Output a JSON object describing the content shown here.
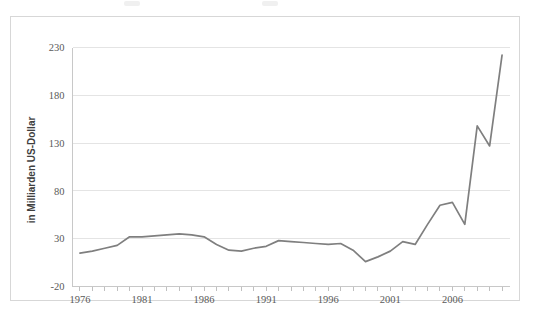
{
  "figure": {
    "background_color": "#ffffff",
    "frame_border_color": "#d7d7d7"
  },
  "chart_data": {
    "type": "line",
    "title": "",
    "subtitle": "",
    "xlabel": "",
    "ylabel": "in Milliarden US-Dollar",
    "xlim": [
      1975.4,
      2010.6
    ],
    "ylim": [
      -20,
      230
    ],
    "grid": true,
    "legend_position": "none",
    "line_color": "#7f7f7f",
    "gridline_color": "#e4e4e4",
    "ytick_labels": [
      "230",
      "180",
      "130",
      "80",
      "30",
      "-20"
    ],
    "yticks": [
      230,
      180,
      130,
      80,
      30,
      -20
    ],
    "xtick_labels": [
      "1976",
      "1981",
      "1986",
      "1991",
      "1996",
      "2001",
      "2006"
    ],
    "xticks": [
      1976,
      1981,
      1986,
      1991,
      1996,
      2001,
      2006
    ],
    "x": [
      1976,
      1977,
      1978,
      1979,
      1980,
      1981,
      1982,
      1983,
      1984,
      1985,
      1986,
      1987,
      1988,
      1989,
      1990,
      1991,
      1992,
      1993,
      1994,
      1995,
      1996,
      1997,
      1998,
      1999,
      2000,
      2001,
      2002,
      2003,
      2004,
      2005,
      2006,
      2007,
      2008,
      2009,
      2010
    ],
    "series": [
      {
        "name": "in Milliarden US-Dollar",
        "values": [
          15,
          17,
          20,
          23,
          32,
          32,
          33,
          34,
          35,
          34,
          32,
          24,
          18,
          17,
          20,
          22,
          28,
          27,
          26,
          25,
          24,
          25,
          18,
          6,
          11,
          17,
          27,
          24,
          45,
          65,
          68,
          45,
          148,
          127,
          222
        ]
      }
    ]
  }
}
